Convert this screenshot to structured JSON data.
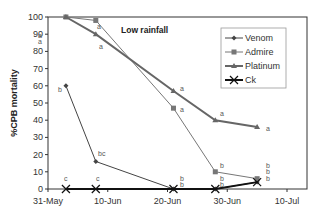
{
  "chart_data": {
    "type": "line",
    "title": "Low rainfall",
    "xlabel": "",
    "ylabel": "%CPB mortality",
    "ylim": [
      0,
      100
    ],
    "yticks": [
      0,
      10,
      20,
      30,
      40,
      50,
      60,
      70,
      80,
      90,
      100
    ],
    "xlim": [
      "31-May",
      "10-Jul"
    ],
    "xtick_labels": [
      "31-May",
      "10-Jun",
      "20-Jun",
      "30-Jun",
      "10-Jul"
    ],
    "x": [
      "3-Jun",
      "8-Jun",
      "21-Jun",
      "28-Jun",
      "5-Jul"
    ],
    "x_days_from_31May": [
      3,
      8,
      21,
      28,
      35
    ],
    "grid": false,
    "legend_position": "upper right inside",
    "series": [
      {
        "name": "Venom",
        "marker": "diamond",
        "color": "#444444",
        "width": 1,
        "values": [
          60,
          16,
          0,
          0,
          4
        ],
        "letters": [
          "b",
          "bc",
          "b",
          "b",
          "b"
        ]
      },
      {
        "name": "Admire",
        "marker": "square",
        "color": "#777777",
        "width": 1,
        "values": [
          100,
          98,
          47,
          10,
          6
        ],
        "letters": [
          "a",
          "a",
          "a",
          "b",
          "b"
        ]
      },
      {
        "name": "Platinum",
        "marker": "triangle",
        "color": "#666666",
        "width": 2,
        "values": [
          100,
          90,
          57,
          40,
          36
        ],
        "letters": [
          "a",
          "a",
          "a",
          "a",
          "a"
        ]
      },
      {
        "name": "Ck",
        "marker": "x",
        "color": "#111111",
        "width": 2,
        "values": [
          0,
          0,
          0,
          0,
          4
        ],
        "letters": [
          "c",
          "c",
          "b",
          "b",
          "b"
        ]
      }
    ]
  }
}
